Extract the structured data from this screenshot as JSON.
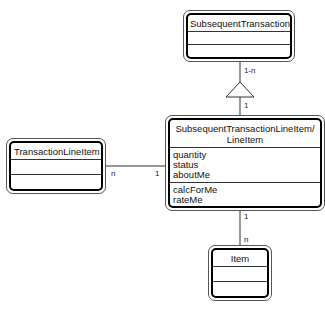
{
  "diagram": {
    "type": "UML class diagram",
    "classes": {
      "subsequent_transaction": {
        "name": "SubsequentTransaction",
        "attributes": [],
        "operations": []
      },
      "main": {
        "name_line1": "SubsequentTransactionLineItem/",
        "name_line2": "LineItem",
        "attributes": [
          "quantity",
          "status",
          "aboutMe"
        ],
        "operations": [
          "calcForMe",
          "rateMe"
        ]
      },
      "transaction_line_item": {
        "name": "TransactionLineItem",
        "attributes": [],
        "operations": []
      },
      "item": {
        "name": "Item",
        "attributes": [],
        "operations": []
      }
    },
    "relationships": [
      {
        "from": "SubsequentTransactionLineItem/LineItem",
        "to": "SubsequentTransaction",
        "kind": "generalization",
        "mult_top": "1-n",
        "mult_bottom": "1"
      },
      {
        "from": "TransactionLineItem",
        "to": "SubsequentTransactionLineItem/LineItem",
        "kind": "association",
        "mult_left": "n",
        "mult_right": "1"
      },
      {
        "from": "SubsequentTransactionLineItem/LineItem",
        "to": "Item",
        "kind": "association",
        "mult_top": "1",
        "mult_bottom": "n"
      }
    ]
  },
  "labels": {
    "gen_top": "1-n",
    "gen_bottom": "1",
    "assoc_left_n": "n",
    "assoc_left_1": "1",
    "assoc_item_1": "1",
    "assoc_item_n": "n"
  }
}
